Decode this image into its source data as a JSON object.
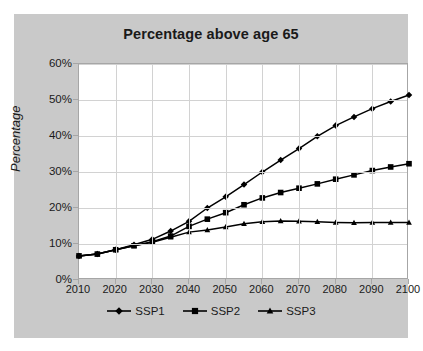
{
  "chart_data": {
    "type": "line",
    "title": "Percentage above age 65",
    "xlabel": "",
    "ylabel": "Percentage",
    "xlim": [
      2010,
      2100
    ],
    "ylim": [
      0,
      60
    ],
    "grid": true,
    "legend_position": "bottom",
    "x": [
      2010,
      2015,
      2020,
      2025,
      2030,
      2035,
      2040,
      2045,
      2050,
      2055,
      2060,
      2065,
      2070,
      2075,
      2080,
      2085,
      2090,
      2095,
      2100
    ],
    "y_ticklabels": [
      "0%",
      "10%",
      "20%",
      "30%",
      "40%",
      "50%",
      "60%"
    ],
    "y_tickvalues": [
      0,
      10,
      20,
      30,
      40,
      50,
      60
    ],
    "x_ticklabels": [
      "2010",
      "2020",
      "2030",
      "2040",
      "2050",
      "2060",
      "2070",
      "2080",
      "2090",
      "2100"
    ],
    "x_tickvalues": [
      2010,
      2020,
      2030,
      2040,
      2050,
      2060,
      2070,
      2080,
      2090,
      2100
    ],
    "series": [
      {
        "name": "SSP1",
        "marker": "diamond",
        "color": "#000000",
        "values": [
          6.7,
          7.2,
          8.4,
          9.8,
          11.3,
          13.6,
          16.3,
          20.0,
          23.1,
          26.5,
          30.0,
          33.3,
          36.5,
          39.9,
          42.9,
          45.3,
          47.6,
          49.6,
          51.4
        ]
      },
      {
        "name": "SSP2",
        "marker": "square",
        "color": "#000000",
        "values": [
          6.7,
          7.2,
          8.4,
          9.5,
          10.6,
          12.2,
          14.9,
          16.9,
          18.7,
          20.9,
          22.8,
          24.3,
          25.5,
          26.7,
          28.0,
          29.2,
          30.4,
          31.4,
          32.3
        ]
      },
      {
        "name": "SSP3",
        "marker": "triangle",
        "color": "#000000",
        "values": [
          6.7,
          7.2,
          8.4,
          9.5,
          10.5,
          11.9,
          13.3,
          13.9,
          14.7,
          15.6,
          16.2,
          16.4,
          16.3,
          16.2,
          16.0,
          15.9,
          16.0,
          16.0,
          16.0
        ]
      }
    ]
  }
}
